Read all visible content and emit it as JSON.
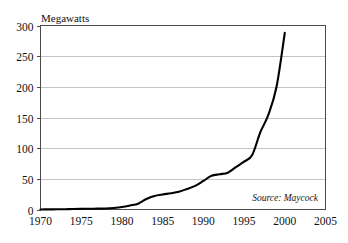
{
  "chart_data": {
    "type": "line",
    "title": "Megawatts",
    "xlabel": "",
    "ylabel": "Megawatts",
    "xlim": [
      1970,
      2005
    ],
    "ylim": [
      0,
      300
    ],
    "ytick_step": 50,
    "xtick_step": 5,
    "grid": "horizontal",
    "legend": "none",
    "annotation": "Source: Maycock",
    "xticks": [
      "1970",
      "1975",
      "1980",
      "1985",
      "1990",
      "1995",
      "2000",
      "2005"
    ],
    "yticks": [
      "0",
      "50",
      "100",
      "150",
      "200",
      "250",
      "300"
    ],
    "series": [
      {
        "name": "Photovoltaic production",
        "color": "#000000",
        "x": [
          1970,
          1971,
          1972,
          1973,
          1974,
          1975,
          1976,
          1977,
          1978,
          1979,
          1980,
          1981,
          1982,
          1983,
          1984,
          1985,
          1986,
          1987,
          1988,
          1989,
          1990,
          1991,
          1992,
          1993,
          1994,
          1995,
          1996,
          1997,
          1998,
          1999,
          2000
        ],
        "values": [
          0.1,
          0.2,
          0.3,
          0.5,
          0.8,
          1.0,
          1.2,
          1.4,
          1.6,
          2.5,
          4.0,
          6.5,
          9.5,
          17.0,
          22.0,
          24.5,
          26.5,
          29.0,
          33.5,
          38.5,
          46.5,
          55.0,
          57.5,
          60.0,
          69.0,
          78.0,
          89.0,
          126.0,
          155.0,
          201.0,
          288.0
        ]
      }
    ]
  },
  "figure": {
    "background_color": "#ffffff",
    "axis_color": "#4a4a4a",
    "grid_color": "#b4b4b4",
    "line_color": "#000000"
  }
}
